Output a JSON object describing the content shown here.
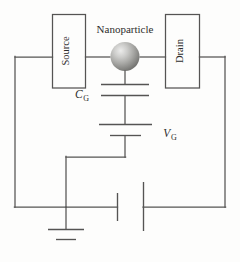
{
  "diagram": {
    "background_color": "#fdfdfc",
    "line_color": "#555453",
    "text_color": "#2e2d2c",
    "labels": {
      "source": "Source",
      "drain": "Drain",
      "nanoparticle": "Nanoparticle",
      "gate_capacitor": "C",
      "gate_capacitor_sub": "G",
      "gate_voltage": "V",
      "gate_voltage_sub": "G"
    },
    "components": [
      {
        "name": "source-electrode",
        "type": "box",
        "label": "Source"
      },
      {
        "name": "drain-electrode",
        "type": "box",
        "label": "Drain"
      },
      {
        "name": "nanoparticle",
        "type": "sphere",
        "label": "Nanoparticle"
      },
      {
        "name": "gate-capacitor",
        "type": "capacitor",
        "label": "C_G"
      },
      {
        "name": "gate-voltage-source",
        "type": "battery",
        "label": "V_G"
      },
      {
        "name": "bias-voltage-source",
        "type": "battery",
        "label": ""
      },
      {
        "name": "ground",
        "type": "ground",
        "label": ""
      }
    ],
    "sphere": {
      "highlight_color": "#e8e8e6",
      "mid_color": "#a9a9a6",
      "edge_color": "#6f6f6c"
    }
  }
}
